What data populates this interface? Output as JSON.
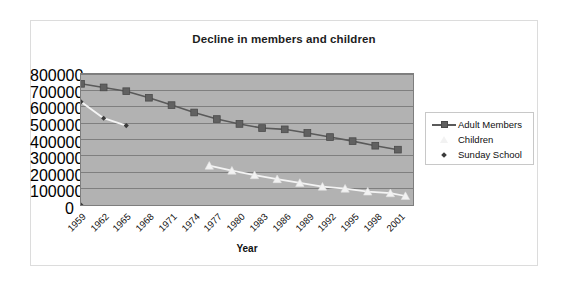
{
  "chart_data": {
    "type": "line",
    "title": "Decline in members and children",
    "xlabel": "Year",
    "ylabel": "",
    "grid": true,
    "legend_position": "right",
    "plot_background": "#b2b2b2",
    "x": [
      1959,
      1962,
      1965,
      1968,
      1971,
      1974,
      1977,
      1980,
      1983,
      1986,
      1989,
      1992,
      1995,
      1998,
      2001
    ],
    "categories": [
      "1959",
      "1962",
      "1965",
      "1968",
      "1971",
      "1974",
      "1977",
      "1980",
      "1983",
      "1986",
      "1989",
      "1992",
      "1995",
      "1998",
      "2001"
    ],
    "xlim": [
      1959,
      2003
    ],
    "ylim": [
      0,
      800000
    ],
    "yticks": [
      0,
      100000,
      200000,
      300000,
      400000,
      500000,
      600000,
      700000,
      800000
    ],
    "ytick_labels": [
      "0",
      "100000",
      "200000",
      "300000",
      "400000",
      "500000",
      "600000",
      "700000",
      "800000"
    ],
    "series": [
      {
        "name": "Adult Members",
        "color": "#616161",
        "marker": "square",
        "x": [
          1959,
          1962,
          1965,
          1968,
          1971,
          1974,
          1977,
          1980,
          1983,
          1986,
          1989,
          1992,
          1995,
          1998,
          2001
        ],
        "values": [
          740000,
          718000,
          695000,
          655000,
          610000,
          565000,
          525000,
          495000,
          470000,
          462000,
          440000,
          415000,
          390000,
          362000,
          338000
        ]
      },
      {
        "name": "Children",
        "color": "#f2f2f2",
        "marker": "triangle",
        "x": [
          1976,
          1979,
          1982,
          1985,
          1988,
          1991,
          1994,
          1997,
          2000,
          2002
        ],
        "values": [
          240000,
          210000,
          182000,
          158000,
          135000,
          112000,
          100000,
          82000,
          72000,
          55000
        ]
      },
      {
        "name": "Sunday School",
        "color": "#f2f2f2",
        "marker": "diamond",
        "x": [
          1959,
          1962,
          1965
        ],
        "values": [
          630000,
          530000,
          485000
        ],
        "extra_points": [
          {
            "x": 1959,
            "y": 0
          }
        ]
      }
    ]
  },
  "chart": {
    "title": "Decline in members and children",
    "x_axis_title": "Year",
    "legend": {
      "items": [
        {
          "label": "Adult Members",
          "marker": "square",
          "color": "#616161",
          "has_line": true
        },
        {
          "label": "Children",
          "marker": "triangle",
          "color": "#f2f2f2",
          "has_line": false
        },
        {
          "label": "Sunday School",
          "marker": "diamond",
          "color": "#3b3b3b",
          "has_line": false
        }
      ]
    }
  }
}
